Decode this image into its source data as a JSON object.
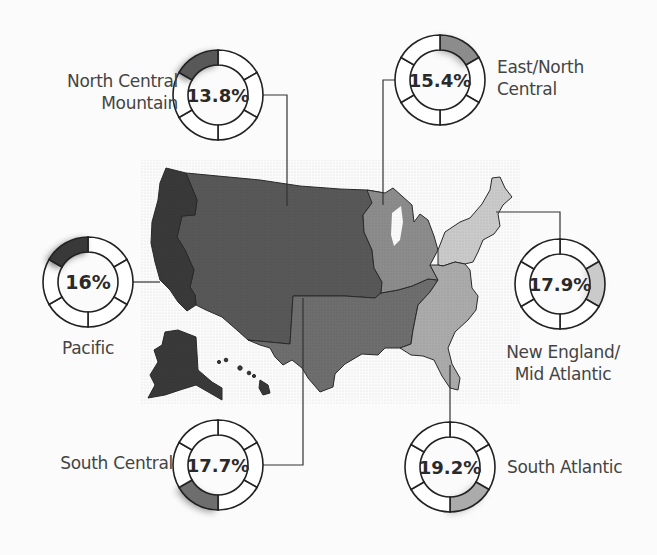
{
  "chart_data": {
    "type": "pie",
    "title": "",
    "categories": [
      "North Central Mountain",
      "East/North Central",
      "Pacific",
      "New England/Mid Atlantic",
      "South Central",
      "South Atlantic"
    ],
    "values": [
      13.8,
      15.4,
      16,
      17.9,
      17.7,
      19.2
    ],
    "value_labels": [
      "13.8%",
      "15.4%",
      "16%",
      "17.9%",
      "17.7%",
      "19.2%"
    ],
    "unit": "%"
  },
  "regions": [
    {
      "id": "ncm",
      "label_lines": [
        "North Central",
        "Mountain"
      ],
      "value": "13.8%",
      "color": "#585858"
    },
    {
      "id": "enc",
      "label_lines": [
        "East/North",
        "Central"
      ],
      "value": "15.4%",
      "color": "#8c8c8c"
    },
    {
      "id": "pac",
      "label_lines": [
        "Pacific"
      ],
      "value": "16%",
      "color": "#393939"
    },
    {
      "id": "ne",
      "label_lines": [
        "New England/",
        "Mid Atlantic"
      ],
      "value": "17.9%",
      "color": "#cacaca"
    },
    {
      "id": "sc",
      "label_lines": [
        "South Central"
      ],
      "value": "17.7%",
      "color": "#6e6e6e"
    },
    {
      "id": "sa",
      "label_lines": [
        "South Atlantic"
      ],
      "value": "19.2%",
      "color": "#ababab"
    }
  ]
}
